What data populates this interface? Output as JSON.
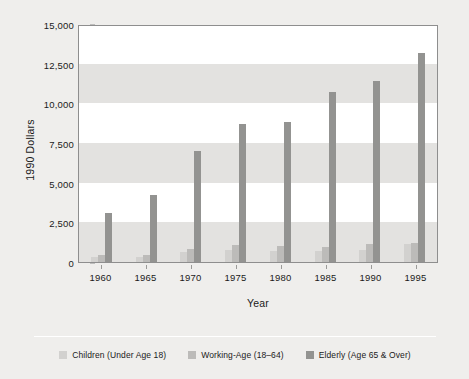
{
  "chart_data": {
    "type": "bar",
    "title": "",
    "xlabel": "Year",
    "ylabel": "1990 Dollars",
    "categories": [
      "1960",
      "1965",
      "1970",
      "1975",
      "1980",
      "1985",
      "1990",
      "1995"
    ],
    "ylim": [
      0,
      15000
    ],
    "yticks": [
      0,
      2500,
      5000,
      7500,
      10000,
      12500,
      15000
    ],
    "ytick_labels": [
      "0",
      "2,500",
      "5,000",
      "7,500",
      "10,000",
      "12,500",
      "15,000"
    ],
    "grid": "alternating-horizontal-bands",
    "legend_position": "bottom",
    "series": [
      {
        "name": "Children (Under Age 18)",
        "color": "#d2d1cf",
        "values": [
          300,
          320,
          600,
          750,
          700,
          700,
          780,
          1150
        ]
      },
      {
        "name": "Working-Age (18–64)",
        "color": "#bcbbb9",
        "values": [
          420,
          450,
          800,
          1080,
          980,
          950,
          1150,
          1200
        ]
      },
      {
        "name": "Elderly (Age 65 & Over)",
        "color": "#939391",
        "values": [
          3100,
          4200,
          7000,
          8700,
          8850,
          10700,
          11400,
          13200
        ]
      }
    ]
  },
  "legend": {
    "items": [
      {
        "label": "Children (Under Age 18)"
      },
      {
        "label": "Working-Age (18–64)"
      },
      {
        "label": "Elderly (Age 65 & Over)"
      }
    ]
  }
}
